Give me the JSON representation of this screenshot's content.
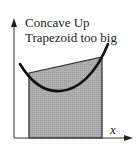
{
  "diagram": {
    "title_line1": "Concave Up",
    "title_line2": "Trapezoid too big",
    "x_axis_label": "x",
    "colors": {
      "background": "#ffffff",
      "axis": "#333333",
      "curve": "#111111",
      "trapezoid_fill": "#a9a9a9",
      "trapezoid_edge": "#2a2a2a"
    },
    "trapezoid": {
      "left_x": 29,
      "right_x": 102,
      "left_top_y": 73,
      "right_top_y": 57,
      "base_y": 138
    },
    "curve_points": "M20,64 Q58,116 108,44"
  }
}
